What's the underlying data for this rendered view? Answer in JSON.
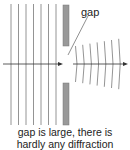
{
  "diagram": {
    "label": "gap",
    "caption_line1": "gap is large, there is",
    "caption_line2": "hardly any diffraction",
    "colors": {
      "line": "#888888",
      "barrier": "#999999",
      "arrow": "#333333"
    },
    "incoming_wavefronts": 7,
    "outgoing_wavefronts": 7
  }
}
